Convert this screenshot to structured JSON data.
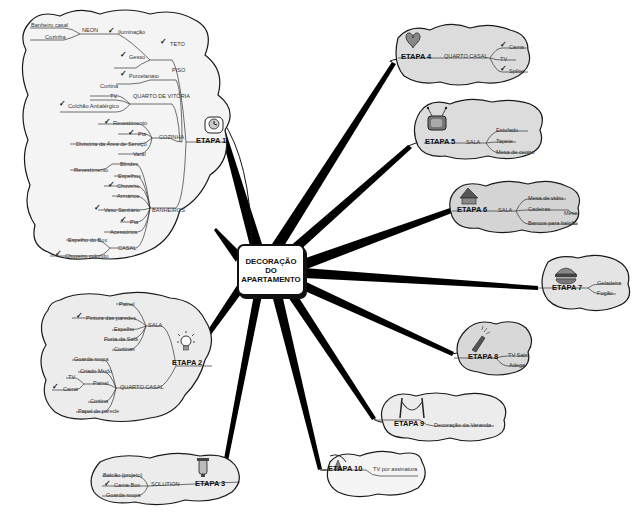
{
  "center": {
    "line1": "DECORAÇÃO",
    "line2": "DO",
    "line3": "APARTAMENTO"
  },
  "etapas": [
    {
      "id": 1,
      "label": "ETAPA 1",
      "icon": "clock-timer-icon",
      "groups": [
        {
          "label": "TETO",
          "checked": true,
          "items": [
            {
              "label": "Iluminação",
              "checked": true,
              "children": [
                {
                  "label": "NEON",
                  "children": [
                    {
                      "label": "Banheiro casal"
                    },
                    {
                      "label": "Cozinha"
                    }
                  ]
                }
              ]
            },
            {
              "label": "Gesso",
              "checked": true
            }
          ]
        },
        {
          "label": "PISO",
          "items": [
            {
              "label": "Porcelanato",
              "checked": true
            }
          ]
        },
        {
          "label": "QUARTO DE VITÓRIA",
          "items": [
            {
              "label": "Cortina"
            },
            {
              "label": "TV"
            },
            {
              "label": "Colchão Antialérgico",
              "checked": true
            }
          ]
        },
        {
          "label": "COZINHA",
          "items": [
            {
              "label": "Revestimento",
              "checked": true
            },
            {
              "label": "Pia",
              "checked": true
            },
            {
              "label": "Divisória da Área de Serviço"
            },
            {
              "label": "Varal"
            }
          ]
        },
        {
          "label": "BANHEIROS",
          "items": [
            {
              "label": "Blindex",
              "children": [
                {
                  "label": "Revestimento"
                }
              ]
            },
            {
              "label": "Espelhos"
            },
            {
              "label": "Chuveiro",
              "checked": true
            },
            {
              "label": "Armários"
            },
            {
              "label": "Vaso Sanitário",
              "checked": true
            },
            {
              "label": "Pia",
              "checked": true
            },
            {
              "label": "Acessórios"
            },
            {
              "label": "CASAL",
              "children": [
                {
                  "label": "Espelho do Box"
                },
                {
                  "label": "Chuveiro colorido",
                  "checked": true
                }
              ]
            }
          ]
        }
      ]
    },
    {
      "id": 2,
      "label": "ETAPA 2",
      "icon": "lightbulb-icon",
      "groups": [
        {
          "label": "SALA",
          "items": [
            {
              "label": "Painel"
            },
            {
              "label": "Pintura das paredes",
              "checked": true
            },
            {
              "label": "Espelho"
            },
            {
              "label": "Porta da Sala"
            },
            {
              "label": "Cortinas"
            }
          ]
        },
        {
          "label": "QUARTO CASAL",
          "items": [
            {
              "label": "Guarda roupa"
            },
            {
              "label": "Criado Mudo"
            },
            {
              "label": "Painel",
              "children": [
                {
                  "label": "TV"
                },
                {
                  "label": "Cama",
                  "checked": true
                }
              ]
            },
            {
              "label": "Cortina"
            },
            {
              "label": "Papel de parede"
            }
          ]
        }
      ]
    },
    {
      "id": 3,
      "label": "ETAPA 3",
      "icon": "lantern-icon",
      "groups": [
        {
          "label": "SOLUTION",
          "items": [
            {
              "label": "Balcão (projeto)"
            },
            {
              "label": "Cama Box",
              "checked": true
            },
            {
              "label": "Guarda roupa"
            }
          ]
        }
      ]
    },
    {
      "id": 4,
      "label": "ETAPA 4",
      "icon": "heart-icon",
      "groups": [
        {
          "label": "QUARTO CASAL",
          "items": [
            {
              "label": "Cama",
              "checked": true
            },
            {
              "label": "TV"
            },
            {
              "label": "Spliter",
              "checked": true
            }
          ]
        }
      ]
    },
    {
      "id": 5,
      "label": "ETAPA 5",
      "icon": "television-icon",
      "groups": [
        {
          "label": "SALA",
          "items": [
            {
              "label": "Estofado"
            },
            {
              "label": "Tapete"
            },
            {
              "label": "Mesa de centro"
            }
          ]
        }
      ]
    },
    {
      "id": 6,
      "label": "ETAPA 6",
      "icon": "house-icon",
      "groups": [
        {
          "label": "SALA",
          "items": [
            {
              "label": "Mesa de vidro"
            },
            {
              "label": "Cadeiras",
              "children": [
                {
                  "label": "Mesa"
                }
              ]
            },
            {
              "label": "Bancos para balcão"
            }
          ]
        }
      ]
    },
    {
      "id": 7,
      "label": "ETAPA 7",
      "icon": "hamburger-icon",
      "groups": [
        {
          "label": "",
          "items": [
            {
              "label": "Geladeira"
            },
            {
              "label": "Fogão"
            }
          ]
        }
      ]
    },
    {
      "id": 8,
      "label": "ETAPA 8",
      "icon": "champagne-bottle-icon",
      "groups": [
        {
          "label": "",
          "items": [
            {
              "label": "TV Sala"
            },
            {
              "label": "Adega"
            }
          ]
        }
      ]
    },
    {
      "id": 9,
      "label": "ETAPA 9",
      "icon": "hammock-icon",
      "groups": [
        {
          "label": "",
          "items": [
            {
              "label": "Decoração da Varanda"
            }
          ]
        }
      ]
    },
    {
      "id": 10,
      "label": "ETAPA 10",
      "icon": "satellite-dish-icon",
      "groups": [
        {
          "label": "",
          "items": [
            {
              "label": "TV por assinatura"
            }
          ]
        }
      ]
    }
  ],
  "colors": {
    "cloud_fill": "#ececec",
    "cloud_stroke": "#1a1a1a",
    "branch": "#000000",
    "background": "#ffffff"
  },
  "check_glyph": "✓"
}
